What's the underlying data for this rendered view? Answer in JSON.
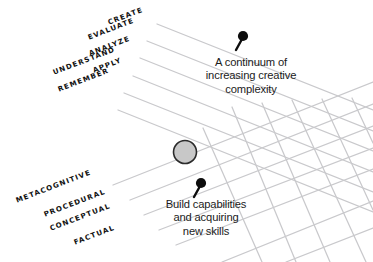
{
  "diagram": {
    "background_color": "#ffffff",
    "grid_color": "#c9c9cc",
    "label_color": "#111111",
    "note_color": "#1b1b1b",
    "node": {
      "name": "intersection-node",
      "fill_color": "#c8c8c8",
      "stroke_color": "#2b2b2b",
      "cx": 185,
      "cy": 152,
      "r": 11.5
    },
    "cognitive_process_dimension": {
      "axis_name": "cognitive-process-dimension",
      "rotation_deg": -21,
      "levels": [
        {
          "label": "CREATE",
          "x": 108,
          "y": 18
        },
        {
          "label": "EVALUATE",
          "x": 88,
          "y": 33
        },
        {
          "label": "ANALYZE",
          "x": 89,
          "y": 49
        },
        {
          "label": "APPLY",
          "x": 93,
          "y": 66
        },
        {
          "label": "UNDERSTAND",
          "x": 53,
          "y": 68
        },
        {
          "label": "REMEMBER",
          "x": 58,
          "y": 85
        }
      ]
    },
    "knowledge_dimension": {
      "axis_name": "knowledge-dimension",
      "rotation_deg": -21,
      "levels": [
        {
          "label": "METACOGNITIVE",
          "x": 16,
          "y": 196
        },
        {
          "label": "PROCEDURAL",
          "x": 44,
          "y": 210
        },
        {
          "label": "CONCEPTUAL",
          "x": 50,
          "y": 224
        },
        {
          "label": "FACTUAL",
          "x": 74,
          "y": 238
        }
      ]
    },
    "annotations": [
      {
        "name": "continuum-annotation",
        "text": "A continuum of\nincreasing creative\ncomplexity",
        "x": 196,
        "y": 56,
        "width": 110,
        "pin": {
          "name": "pin-marker-top",
          "x": 241,
          "y": 36,
          "angle_deg": 28
        }
      },
      {
        "name": "capabilities-annotation",
        "text": "Build capabilities\nand acquiring\nnew skills",
        "x": 148,
        "y": 198,
        "width": 116,
        "pin": {
          "name": "pin-marker-bottom",
          "x": 199,
          "y": 183,
          "angle_deg": 28
        }
      }
    ]
  }
}
